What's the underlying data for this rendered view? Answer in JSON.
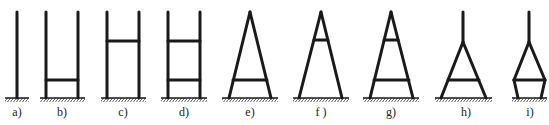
{
  "figure": {
    "colors": {
      "stroke": "#1a1a1a",
      "background": "#ffffff"
    },
    "panels": [
      {
        "id": "a",
        "label": "a)",
        "type": "single-pole",
        "crossbars": 0
      },
      {
        "id": "b",
        "label": "b)",
        "type": "H-frame",
        "crossbars": 1,
        "crossbar_position": "low"
      },
      {
        "id": "c",
        "label": "c)",
        "type": "H-frame",
        "crossbars": 1,
        "crossbar_position": "high"
      },
      {
        "id": "d",
        "label": "d)",
        "type": "H-frame",
        "crossbars": 2,
        "crossbar_position": "high+low"
      },
      {
        "id": "e",
        "label": "e)",
        "type": "A-frame",
        "crossbars": 1,
        "crossbar_position": "low"
      },
      {
        "id": "f",
        "label": "f )",
        "type": "A-frame",
        "crossbars": 1,
        "crossbar_position": "high"
      },
      {
        "id": "g",
        "label": "g)",
        "type": "A-frame",
        "crossbars": 2,
        "crossbar_position": "high+low"
      },
      {
        "id": "h",
        "label": "h)",
        "type": "A-frame-with-mast",
        "crossbars": 1,
        "crossbar_position": "low"
      },
      {
        "id": "i",
        "label": "i)",
        "type": "diamond-with-mast",
        "crossbars": 1,
        "crossbar_position": "mid"
      }
    ]
  }
}
